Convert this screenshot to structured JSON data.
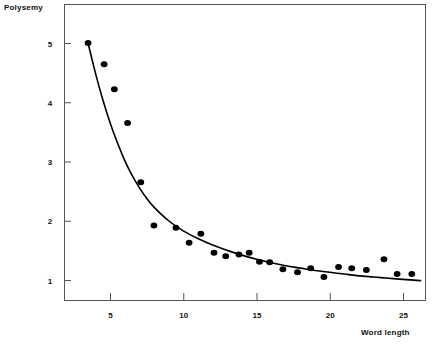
{
  "chart_data": {
    "type": "scatter",
    "title": "",
    "xlabel": "Word length",
    "ylabel": "Polysemy",
    "xlim": [
      2.0,
      26.5
    ],
    "ylim": [
      0.55,
      5.6
    ],
    "grid": false,
    "legend": null,
    "xticks": [
      5,
      10,
      15,
      20,
      25
    ],
    "xticklabels": [
      "5",
      "10",
      "15",
      "20",
      "25"
    ],
    "yticks": [
      1,
      2,
      3,
      4,
      5
    ],
    "yticklabels": [
      "1",
      "2",
      "3",
      "4",
      "5"
    ],
    "series": [
      {
        "name": "observed polysemy",
        "type": "scatter",
        "marker": "filled-circle",
        "color": "#000000",
        "points": [
          {
            "x": 3.5,
            "y": 5.0
          },
          {
            "x": 4.6,
            "y": 4.64
          },
          {
            "x": 5.3,
            "y": 4.22
          },
          {
            "x": 6.2,
            "y": 3.65
          },
          {
            "x": 7.1,
            "y": 2.65
          },
          {
            "x": 8.0,
            "y": 1.92
          },
          {
            "x": 9.5,
            "y": 1.88
          },
          {
            "x": 10.4,
            "y": 1.63
          },
          {
            "x": 11.2,
            "y": 1.78
          },
          {
            "x": 12.1,
            "y": 1.46
          },
          {
            "x": 12.9,
            "y": 1.4
          },
          {
            "x": 13.8,
            "y": 1.43
          },
          {
            "x": 14.5,
            "y": 1.46
          },
          {
            "x": 15.2,
            "y": 1.31
          },
          {
            "x": 15.9,
            "y": 1.3
          },
          {
            "x": 16.8,
            "y": 1.18
          },
          {
            "x": 17.8,
            "y": 1.13
          },
          {
            "x": 18.7,
            "y": 1.2
          },
          {
            "x": 19.6,
            "y": 1.05
          },
          {
            "x": 20.6,
            "y": 1.22
          },
          {
            "x": 21.5,
            "y": 1.2
          },
          {
            "x": 22.5,
            "y": 1.17
          },
          {
            "x": 23.7,
            "y": 1.35
          },
          {
            "x": 24.6,
            "y": 1.1
          },
          {
            "x": 25.6,
            "y": 1.1
          }
        ]
      },
      {
        "name": "fitted curve",
        "type": "line",
        "color": "#000000",
        "points": [
          {
            "x": 3.5,
            "y": 5.0
          },
          {
            "x": 4.0,
            "y": 4.5
          },
          {
            "x": 4.5,
            "y": 4.05
          },
          {
            "x": 5.0,
            "y": 3.66
          },
          {
            "x": 5.5,
            "y": 3.32
          },
          {
            "x": 6.0,
            "y": 3.02
          },
          {
            "x": 6.5,
            "y": 2.77
          },
          {
            "x": 7.0,
            "y": 2.56
          },
          {
            "x": 7.5,
            "y": 2.38
          },
          {
            "x": 8.0,
            "y": 2.23
          },
          {
            "x": 9.0,
            "y": 2.0
          },
          {
            "x": 10.0,
            "y": 1.83
          },
          {
            "x": 11.0,
            "y": 1.7
          },
          {
            "x": 12.0,
            "y": 1.59
          },
          {
            "x": 13.0,
            "y": 1.5
          },
          {
            "x": 14.0,
            "y": 1.42
          },
          {
            "x": 15.0,
            "y": 1.35
          },
          {
            "x": 16.0,
            "y": 1.29
          },
          {
            "x": 17.0,
            "y": 1.24
          },
          {
            "x": 18.0,
            "y": 1.2
          },
          {
            "x": 19.0,
            "y": 1.16
          },
          {
            "x": 20.0,
            "y": 1.13
          },
          {
            "x": 21.0,
            "y": 1.1
          },
          {
            "x": 22.0,
            "y": 1.07
          },
          {
            "x": 23.0,
            "y": 1.05
          },
          {
            "x": 24.0,
            "y": 1.03
          },
          {
            "x": 25.0,
            "y": 1.01
          },
          {
            "x": 26.2,
            "y": 0.99
          }
        ]
      }
    ]
  },
  "plot_geometry": {
    "frame_left": 64,
    "frame_top": 4,
    "frame_right": 425,
    "frame_bottom": 300,
    "x_pixel_at_5": 110,
    "x_pixel_per_unit": 14.65,
    "y_pixel_at_1": 280,
    "y_pixel_per_unit": 59.25,
    "tick_length": 7,
    "marker_radius_x": 3.4,
    "marker_radius_y": 3.0
  }
}
